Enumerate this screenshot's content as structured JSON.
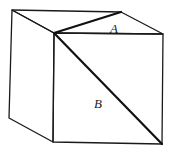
{
  "diagram": {
    "type": "cube-with-face-diagonals",
    "labels": {
      "a": "A",
      "b": "B"
    },
    "vertices": {
      "back_top_left": [
        12,
        10
      ],
      "back_top_right": [
        121,
        12
      ],
      "front_top_left": [
        54,
        33
      ],
      "front_top_right": [
        163,
        34
      ],
      "front_bottom_left": [
        53,
        142
      ],
      "front_bottom_right": [
        162,
        144
      ],
      "back_bottom_left": [
        9,
        118
      ]
    },
    "label_positions": {
      "a": [
        113,
        33
      ],
      "b": [
        96,
        108
      ]
    },
    "colors": {
      "stroke": "#1a1a1a",
      "background": "#ffffff"
    }
  }
}
